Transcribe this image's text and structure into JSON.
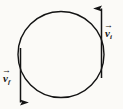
{
  "figure": {
    "kind": "physics-vector-diagram",
    "caption": "Circular path with initial and final velocity vectors",
    "background_color": "#fbfaf7",
    "ink_color": "#131313",
    "width": 123,
    "height": 109
  },
  "circle": {
    "name": "circular-path",
    "center_x": 61,
    "center_y": 54.5,
    "radius": 43,
    "stroke_width": 1.4,
    "fill": "none"
  },
  "vectors": [
    {
      "id": "vi",
      "label_text": "v",
      "label_sub": "i",
      "label_arrow": "→",
      "meaning": "initial-velocity",
      "direction": "up",
      "x": 101.5,
      "y_tail": 78,
      "y_head": 8,
      "label_x": 105,
      "label_y": 24
    },
    {
      "id": "vf",
      "label_text": "v",
      "label_sub": "f",
      "label_arrow": "→",
      "meaning": "final-velocity",
      "direction": "down",
      "x": 20.5,
      "y_tail": 48,
      "y_head": 103,
      "label_x": 3,
      "label_y": 69
    }
  ]
}
